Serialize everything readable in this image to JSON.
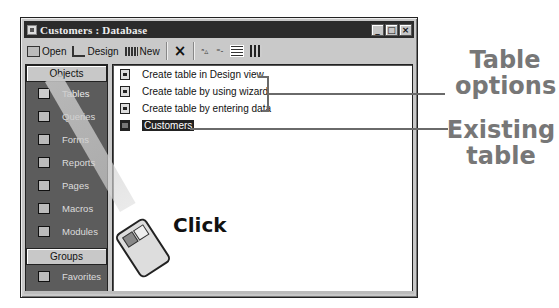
{
  "window": {
    "title": "Customers : Database",
    "controls": {
      "minimize": "_",
      "maximize": "□",
      "close": "×"
    }
  },
  "toolbar": {
    "open_label": "Open",
    "design_label": "Design",
    "new_label": "New",
    "delete_icon": "×",
    "large_icons_glyph": "ᵃ▵",
    "small_icons_glyph": "⁼‐",
    "details_icon": "details-view",
    "list_icon": "list-view"
  },
  "sidebar": {
    "objects_header": "Objects",
    "items": [
      {
        "label": "Tables",
        "icon": "table-icon",
        "active": true
      },
      {
        "label": "Queries",
        "icon": "query-icon"
      },
      {
        "label": "Forms",
        "icon": "form-icon"
      },
      {
        "label": "Reports",
        "icon": "report-icon"
      },
      {
        "label": "Pages",
        "icon": "page-icon"
      },
      {
        "label": "Macros",
        "icon": "macro-icon"
      },
      {
        "label": "Modules",
        "icon": "module-icon"
      }
    ],
    "groups_header": "Groups",
    "groups": [
      {
        "label": "Favorites",
        "icon": "folder-icon"
      }
    ]
  },
  "list": {
    "items": [
      {
        "label": "Create table in Design view",
        "icon": "shortcut-icon"
      },
      {
        "label": "Create table by using wizard",
        "icon": "shortcut-icon"
      },
      {
        "label": "Create table by entering data",
        "icon": "shortcut-icon"
      },
      {
        "label": "Customers",
        "icon": "table-icon",
        "selected": true
      }
    ]
  },
  "annotations": {
    "table_options": "Table\noptions",
    "table_options_line1": "Table",
    "table_options_line2": "options",
    "existing_table_line1": "Existing",
    "existing_table_line2": "table",
    "click": "Click"
  }
}
